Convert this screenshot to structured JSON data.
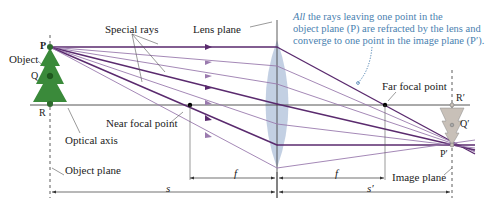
{
  "diagram": {
    "labels": {
      "special_rays": "Special rays",
      "lens_plane": "Lens plane",
      "object": "Object",
      "P": "P",
      "Q": "Q",
      "R": "R",
      "near_focal_point": "Near focal point",
      "far_focal_point": "Far focal point",
      "optical_axis": "Optical axis",
      "object_plane": "Object plane",
      "image_plane": "Image plane",
      "P_prime": "P′",
      "Q_prime": "Q′",
      "R_prime": "R′",
      "f_left": "f",
      "f_right": "f",
      "s": "s",
      "s_prime": "s′"
    },
    "annotation": {
      "emph": "All",
      "line1": " the rays leaving one point in the",
      "line2": "object plane (P) are refracted by the lens and",
      "line3": "converge to one point in the image plane (P′)."
    },
    "colors": {
      "ray_dark": "#5a2a6e",
      "ray_light": "#9a7aae",
      "lens": "#b8c8de",
      "tree": "#3a8a3a",
      "image_tree": "#c8c0b8",
      "annotation": "#4a7fb0",
      "axis": "#555555"
    }
  }
}
